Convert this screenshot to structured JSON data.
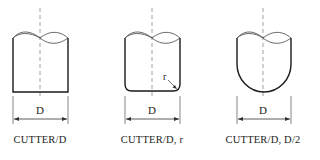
{
  "diagram": {
    "figures": [
      {
        "id": "flat",
        "label": "CUTTER/D",
        "dimension": "D",
        "cx": 40
      },
      {
        "id": "bull-nose",
        "label": "CUTTER/D, r",
        "dimension": "D",
        "radius_label": "r",
        "cx": 152
      },
      {
        "id": "ball-nose",
        "label": "CUTTER/D,  D/2",
        "dimension": "D",
        "cx": 263
      }
    ],
    "colors": {
      "outline": "#1a1a1a",
      "centerline": "#888888",
      "text": "#222222"
    }
  }
}
